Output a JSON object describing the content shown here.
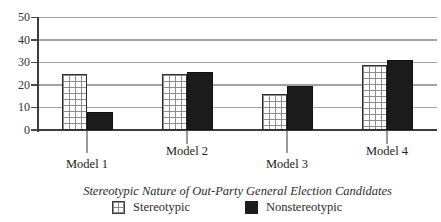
{
  "figure": {
    "legend": [
      {
        "label": "Stereotypic",
        "swatch": "crosshatch-pattern"
      },
      {
        "label": "Nonstereotypic",
        "swatch": "solid-black"
      }
    ]
  },
  "chart_data": {
    "type": "bar",
    "categories": [
      "Model 1",
      "Model 2",
      "Model 3",
      "Model 4"
    ],
    "series": [
      {
        "name": "Stereotypic",
        "style": "crosshatch",
        "values": [
          25,
          25,
          16,
          29
        ]
      },
      {
        "name": "Nonstereotypic",
        "style": "solid-black",
        "values": [
          8,
          26,
          19.5,
          31
        ]
      }
    ],
    "title": "",
    "xlabel": "Stereotypic Nature of Out-Party General Election Candidates",
    "ylabel": "",
    "ylim": [
      0,
      50
    ],
    "yticks": [
      0,
      10,
      20,
      30,
      40,
      50
    ],
    "grid": true,
    "legend_position": "bottom"
  },
  "colors": {
    "background": "#ffffff",
    "bar_solid": "#1c1c1c",
    "bar_outline": "#2d2d2d",
    "pattern_line": "#8d8d8d",
    "gridline": "#a2a2a2",
    "axis": "#3c3c3c",
    "text": "#2b2b2b"
  }
}
